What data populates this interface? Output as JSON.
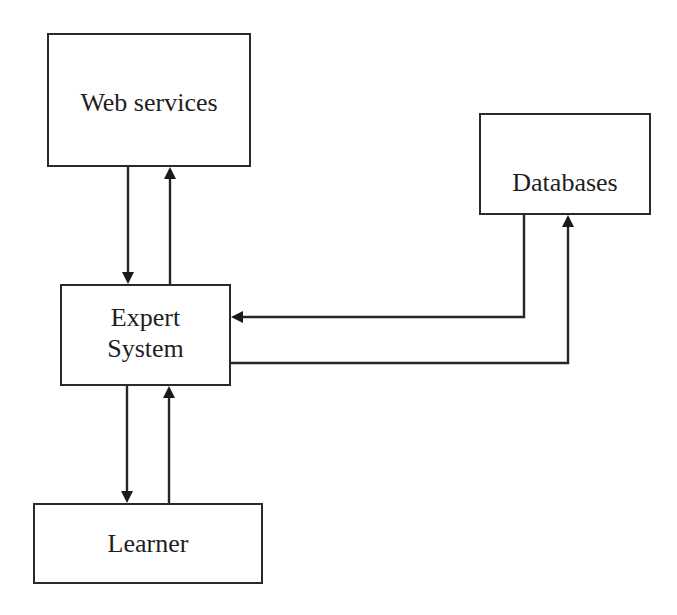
{
  "diagram": {
    "type": "block-flow",
    "nodes": [
      {
        "id": "web",
        "label": "Web services"
      },
      {
        "id": "db",
        "label": "Databases"
      },
      {
        "id": "es",
        "label": "Expert\nSystem"
      },
      {
        "id": "lr",
        "label": "Learner"
      }
    ],
    "edges": [
      {
        "from": "Web services",
        "to": "Expert System",
        "direction": "down"
      },
      {
        "from": "Expert System",
        "to": "Web services",
        "direction": "up"
      },
      {
        "from": "Databases",
        "to": "Expert System",
        "direction": "left"
      },
      {
        "from": "Expert System",
        "to": "Databases",
        "direction": "up-right"
      },
      {
        "from": "Expert System",
        "to": "Learner",
        "direction": "down"
      },
      {
        "from": "Learner",
        "to": "Expert System",
        "direction": "up"
      }
    ],
    "colors": {
      "line": "#262626",
      "box_border": "#2a2a2a",
      "text": "#1e1e1e",
      "background": "#ffffff"
    }
  }
}
